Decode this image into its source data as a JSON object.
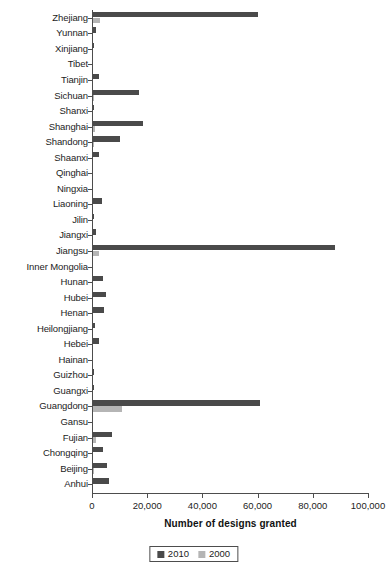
{
  "chart_data": {
    "type": "bar",
    "orientation": "horizontal",
    "title": "",
    "xlabel": "Number of designs granted",
    "ylabel": "",
    "xlim": [
      0,
      100000
    ],
    "xticks": [
      0,
      20000,
      40000,
      60000,
      80000,
      100000
    ],
    "xtick_labels": [
      "0",
      "20,000",
      "40,000",
      "60,000",
      "80,000",
      "100,000"
    ],
    "grid": false,
    "legend_position": "bottom-center",
    "categories": [
      "Zhejiang",
      "Yunnan",
      "Xinjiang",
      "Tibet",
      "Tianjin",
      "Sichuan",
      "Shanxi",
      "Shanghai",
      "Shandong",
      "Shaanxi",
      "Qinghai",
      "Ningxia",
      "Liaoning",
      "Jilin",
      "Jiangxi",
      "Jiangsu",
      "Inner Mongolia",
      "Hunan",
      "Hubei",
      "Henan",
      "Heilongjiang",
      "Hebei",
      "Hainan",
      "Guizhou",
      "Guangxi",
      "Guangdong",
      "Gansu",
      "Fujian",
      "Chongqing",
      "Beijing",
      "Anhui"
    ],
    "series": [
      {
        "name": "2010",
        "color": "#4a4a4a",
        "values": [
          60000,
          1600,
          900,
          60,
          2600,
          17000,
          800,
          18500,
          10200,
          2400,
          120,
          500,
          3600,
          700,
          1500,
          88000,
          500,
          4000,
          5200,
          4400,
          1100,
          2500,
          180,
          800,
          900,
          61000,
          400,
          7300,
          4000,
          5600,
          6000
        ]
      },
      {
        "name": "2000",
        "color": "#b5b5b5",
        "values": [
          3000,
          200,
          150,
          10,
          350,
          900,
          150,
          1000,
          700,
          300,
          20,
          60,
          400,
          120,
          200,
          2600,
          80,
          350,
          500,
          400,
          200,
          300,
          30,
          100,
          120,
          11000,
          60,
          1600,
          250,
          900,
          500
        ]
      }
    ]
  },
  "legend": {
    "entries": [
      {
        "label": "2010"
      },
      {
        "label": "2000"
      }
    ]
  }
}
